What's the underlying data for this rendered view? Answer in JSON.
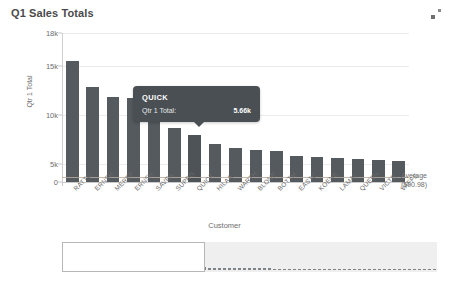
{
  "chart_data": {
    "type": "bar",
    "title": "Q1 Sales Totals",
    "xlabel": "Customer",
    "ylabel": "Qtr 1 Total",
    "ylim": [
      0,
      18000
    ],
    "yticks": [
      "0",
      "5k",
      "10k",
      "15k",
      "18k"
    ],
    "ytick_values": [
      0,
      5000,
      10000,
      15000,
      18000
    ],
    "grid": true,
    "legend": "none",
    "categories": [
      "RATTC",
      "ERNSH",
      "MEREP",
      "ERNSH2",
      "SAVEA",
      "SUPRD",
      "QUICK",
      "HILAA",
      "WARTH",
      "BLONP",
      "BOTTM",
      "EASTC",
      "KOENE",
      "LAMAI",
      "QUEEN",
      "VICTE",
      "VAFFE"
    ],
    "values": [
      14600,
      11500,
      10300,
      10200,
      10200,
      6500,
      5660,
      4600,
      4100,
      3900,
      3800,
      3100,
      3000,
      2900,
      2800,
      2600,
      2500
    ],
    "reference_line": {
      "label": "Average",
      "value_label": "(590.98)",
      "value": 590.98
    },
    "annotations": [
      {
        "type": "tooltip",
        "series": "QUICK",
        "metric_label": "Qtr 1 Total:",
        "value_label": "5.66k"
      }
    ]
  },
  "header": {
    "title": "Q1 Sales Totals"
  },
  "tooltip": {
    "title": "QUICK",
    "metric": "Qtr 1 Total:",
    "value": "5.66k"
  },
  "axes": {
    "y_title": "Qtr 1 Total",
    "x_title": "Customer",
    "y_ticks": [
      "18k",
      "15k",
      "10k",
      "5k",
      "0"
    ]
  },
  "reference": {
    "line1": "Average",
    "line2": "(590.98)"
  },
  "range_selector": {
    "bars": [
      26,
      21,
      19,
      18,
      18,
      13,
      11,
      9,
      8,
      8,
      7,
      6,
      6,
      5,
      5,
      5,
      4,
      4,
      4,
      4,
      3,
      3,
      3,
      3,
      3,
      3,
      3,
      3,
      3,
      2,
      2,
      2,
      2,
      2,
      2,
      2,
      2,
      2,
      2,
      2,
      2,
      2,
      1,
      1,
      1,
      1,
      1,
      1,
      1,
      1,
      1,
      1,
      1,
      1,
      1,
      1,
      1,
      1,
      1,
      1,
      1,
      1,
      1,
      1,
      1,
      1,
      1,
      1,
      1,
      1,
      1,
      1,
      1,
      1,
      1
    ],
    "window_start_pct": 0,
    "window_width_pct": 38
  },
  "colors": {
    "bar": "#555a5e",
    "tooltip_bg": "#4a4f53",
    "reference_line": "#b9aaa0",
    "grid": "#ececec",
    "text": "#6e6e6e"
  }
}
